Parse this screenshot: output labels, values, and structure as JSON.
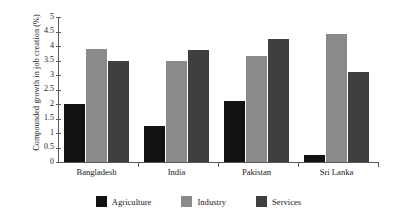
{
  "chart_data": {
    "type": "bar",
    "title": "",
    "subtitle": "",
    "xlabel": "",
    "ylabel": "Compounded growth in job creation (%)",
    "categories": [
      "Bangladesh",
      "India",
      "Pakistan",
      "Sri Lanka"
    ],
    "series": [
      {
        "name": "Agriculture",
        "color": "#121212",
        "values": [
          2.0,
          1.25,
          2.1,
          0.25
        ]
      },
      {
        "name": "Industry",
        "color": "#8a8a8a",
        "values": [
          3.9,
          3.5,
          3.65,
          4.4
        ]
      },
      {
        "name": "Services",
        "color": "#3f3f3f",
        "values": [
          3.5,
          3.85,
          4.25,
          3.1
        ]
      }
    ],
    "ylim": [
      0,
      5
    ],
    "ytick_step": 0.5,
    "ytick_labels": [
      "0",
      "0.5",
      "1",
      "1.5",
      "2",
      "2.5",
      "3",
      "3.5",
      "4",
      "4.5",
      "5"
    ],
    "ytick_values": [
      0,
      0.5,
      1,
      1.5,
      2,
      2.5,
      3,
      3.5,
      4,
      4.5,
      5
    ],
    "grid": false,
    "legend_position": "bottom",
    "annotations": []
  },
  "legend": {
    "items": [
      {
        "label": "Agriculture",
        "color": "#121212"
      },
      {
        "label": "Industry",
        "color": "#8a8a8a"
      },
      {
        "label": "Services",
        "color": "#3f3f3f"
      }
    ]
  }
}
